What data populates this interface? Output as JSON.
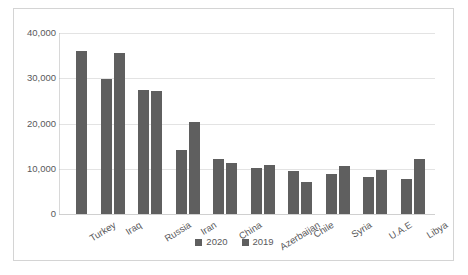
{
  "chart_data": {
    "type": "bar",
    "title": "",
    "subtitle": "",
    "xlabel": "",
    "ylabel": "",
    "categories": [
      "Turkey",
      "Iraq",
      "Russia",
      "Iran",
      "China",
      "Azerbaijan",
      "Chile",
      "Syria",
      "U.A.E",
      "Libya"
    ],
    "series": [
      {
        "name": "2020",
        "color": "#5f5f5f",
        "values": [
          null,
          29800,
          27500,
          14200,
          12200,
          10200,
          9400,
          8900,
          8200,
          7800
        ]
      },
      {
        "name": "2019",
        "color": "#5f5f5f",
        "values": [
          36000,
          35500,
          27100,
          20400,
          11200,
          10900,
          7000,
          10600,
          9700,
          12200
        ]
      }
    ],
    "ylim": [
      0,
      40000
    ],
    "yticks": [
      0,
      10000,
      20000,
      30000,
      40000
    ],
    "ytick_labels": [
      "0",
      "10,000",
      "20,000",
      "30,000",
      "40,000"
    ],
    "grid": true,
    "legend_position": "bottom",
    "legend_entries": [
      "2020",
      "2019"
    ]
  },
  "colors": {
    "bar": "#5f5f5f",
    "gridline": "#e3e3e3",
    "axis": "#d8d8d8",
    "text": "#59595b",
    "border": "#d4d4d4",
    "background": "#ffffff"
  }
}
